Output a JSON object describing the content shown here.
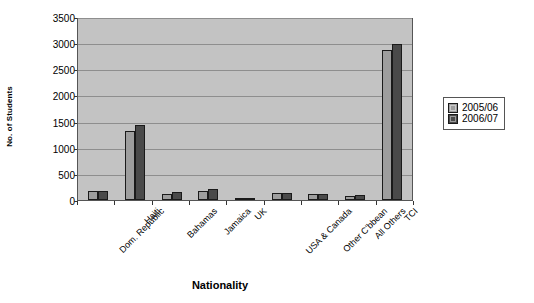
{
  "chart_data": {
    "type": "bar",
    "title": "",
    "xlabel": "Nationality",
    "ylabel": "No. of Students",
    "categories": [
      "Dom. Republic",
      "Haiti",
      "Bahamas",
      "Jamaica",
      "UK",
      "USA & Canada",
      "Other C'bbean",
      "All Others",
      "TCI"
    ],
    "series": [
      {
        "name": "2005/06",
        "color": "#9e9e9e",
        "values": [
          180,
          1320,
          120,
          165,
          45,
          125,
          110,
          75,
          2870
        ]
      },
      {
        "name": "2006/07",
        "color": "#4a4a4a",
        "values": [
          175,
          1440,
          145,
          215,
          40,
          130,
          120,
          95,
          2990
        ]
      }
    ],
    "ylim": [
      0,
      3500
    ],
    "yticks": [
      0,
      500,
      1000,
      1500,
      2000,
      2500,
      3000,
      3500
    ],
    "ytick_labels": [
      "0",
      "500",
      "1000",
      "1500",
      "2000",
      "2500",
      "3000",
      "3500"
    ],
    "grid": true,
    "legend_position": "right",
    "plot_background": "#c3c3c3",
    "gridline_color": "#8e8e8e"
  }
}
